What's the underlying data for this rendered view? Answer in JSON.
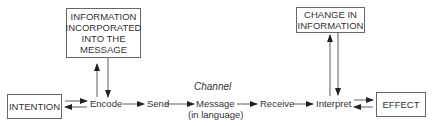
{
  "boxes": {
    "info_incorporated": "INFORMATION INCORPORATED INTO THE MESSAGE",
    "change_in_information": "CHANGE IN INFORMATION",
    "intention": "INTENTION",
    "effect": "EFFECT"
  },
  "nodes": {
    "encode": "Encode",
    "send": "Send",
    "message": "Message",
    "message_sub": "(in language)",
    "receive": "Receive",
    "interpret": "Interpret"
  },
  "channel_label": "Channel"
}
